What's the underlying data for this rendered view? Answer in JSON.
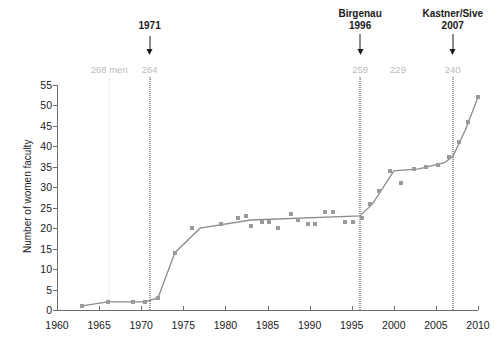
{
  "chart_data": {
    "type": "line",
    "title": "",
    "xlabel": "",
    "ylabel": "Number of women faculty",
    "xlim": [
      1960,
      2010
    ],
    "ylim": [
      0,
      55
    ],
    "xticks": [
      1960,
      1965,
      1970,
      1975,
      1980,
      1985,
      1990,
      1995,
      2000,
      2005,
      2010
    ],
    "yticks": [
      0,
      5,
      10,
      15,
      20,
      25,
      30,
      35,
      40,
      45,
      50,
      55
    ],
    "grid": false,
    "legend": "none",
    "series": [
      {
        "name": "Number of women faculty",
        "type": "line",
        "color": "#8c8c8c",
        "x": [
          1963,
          1966,
          1969,
          1970.5,
          1972,
          1974,
          1977,
          1983,
          1996,
          1997.5,
          2000,
          2003,
          2006,
          2007,
          2008.5,
          2010
        ],
        "values": [
          1,
          2,
          2,
          2,
          3,
          14,
          20,
          22,
          23,
          26,
          34,
          34.5,
          36,
          37.5,
          44,
          52
        ]
      },
      {
        "name": "observations",
        "type": "scatter",
        "color": "#9a9a9a",
        "points": [
          {
            "x": 1963,
            "y": 1
          },
          {
            "x": 1966,
            "y": 2
          },
          {
            "x": 1969,
            "y": 2
          },
          {
            "x": 1970.4,
            "y": 2
          },
          {
            "x": 1972,
            "y": 3
          },
          {
            "x": 1974,
            "y": 14
          },
          {
            "x": 1976,
            "y": 20
          },
          {
            "x": 1979.5,
            "y": 21
          },
          {
            "x": 1981.5,
            "y": 22.5
          },
          {
            "x": 1982.5,
            "y": 23
          },
          {
            "x": 1983,
            "y": 20.5
          },
          {
            "x": 1984.4,
            "y": 21.5
          },
          {
            "x": 1985.2,
            "y": 21.5
          },
          {
            "x": 1986.2,
            "y": 20
          },
          {
            "x": 1987.8,
            "y": 23.5
          },
          {
            "x": 1988.6,
            "y": 22
          },
          {
            "x": 1989.8,
            "y": 21
          },
          {
            "x": 1990.6,
            "y": 21
          },
          {
            "x": 1991.8,
            "y": 24
          },
          {
            "x": 1992.8,
            "y": 24
          },
          {
            "x": 1994.2,
            "y": 21.5
          },
          {
            "x": 1995.2,
            "y": 21.5
          },
          {
            "x": 1996.2,
            "y": 22.5
          },
          {
            "x": 1997.2,
            "y": 26
          },
          {
            "x": 1998.2,
            "y": 29
          },
          {
            "x": 1999.6,
            "y": 34
          },
          {
            "x": 2000.8,
            "y": 31
          },
          {
            "x": 2002.4,
            "y": 34.5
          },
          {
            "x": 2003.8,
            "y": 35
          },
          {
            "x": 2005.2,
            "y": 35.5
          },
          {
            "x": 2006.6,
            "y": 37.5
          },
          {
            "x": 2007.8,
            "y": 41
          },
          {
            "x": 2008.8,
            "y": 46
          },
          {
            "x": 2010,
            "y": 52
          }
        ]
      }
    ],
    "annotations": [
      {
        "id": "a1971",
        "name": "1971",
        "year": "1971",
        "x": 1971,
        "has_arrow": true
      },
      {
        "id": "a1996",
        "name": "Birgenau",
        "year": "1996",
        "x": 1996,
        "has_arrow": true
      },
      {
        "id": "a2007",
        "name": "Kastner/Sive",
        "year": "2007",
        "x": 2007,
        "has_arrow": true
      }
    ],
    "count_labels": [
      {
        "text": "268 men",
        "x": 1966.2,
        "has_line": true
      },
      {
        "text": "264",
        "x": 1971,
        "has_line": true
      },
      {
        "text": "259",
        "x": 1996,
        "has_line": true
      },
      {
        "text": "229",
        "x": 2000.5,
        "has_line": false
      },
      {
        "text": "240",
        "x": 2007,
        "has_line": true
      }
    ]
  },
  "colors": {
    "series": "#8c8c8c",
    "marker": "#9a9a9a",
    "axis": "#6e6e6e",
    "annotation": "#1a1a1a",
    "count_label": "#bcbcbc",
    "vline_dark": "#4a4a4a",
    "vline_light": "#dcdcdc"
  }
}
